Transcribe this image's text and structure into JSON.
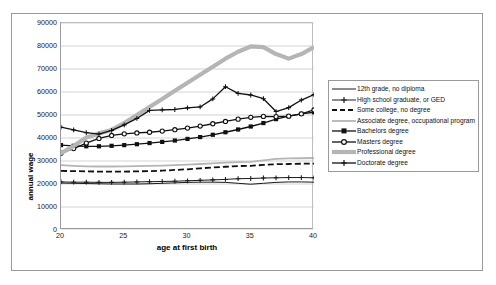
{
  "chart_data": {
    "type": "line",
    "title": "",
    "xlabel": "age at first birth",
    "ylabel": "annual wage",
    "xlim": [
      20,
      40
    ],
    "ylim": [
      0,
      90000
    ],
    "ytick_values": [
      0,
      10000,
      20000,
      30000,
      40000,
      50000,
      60000,
      70000,
      80000,
      90000
    ],
    "ytick_labels": [
      "0",
      "10000",
      "20000",
      "30000",
      "40000",
      "50000",
      "60000",
      "70000",
      "80000",
      "90000"
    ],
    "xtick_values": [
      20,
      25,
      30,
      35,
      40
    ],
    "xtick_labels": [
      "20",
      "25",
      "30",
      "35",
      "40"
    ],
    "grid": "horizontal",
    "legend_position": "right",
    "x": [
      20,
      21,
      22,
      23,
      24,
      25,
      26,
      27,
      28,
      29,
      30,
      31,
      32,
      33,
      34,
      35,
      36,
      37,
      38,
      39,
      40
    ],
    "series": [
      {
        "name": "12th grade, no diploma",
        "color": "#1a1a1a",
        "style": "solid",
        "width": 1.0,
        "marker": "none",
        "values": [
          20400,
          20300,
          20200,
          20100,
          20000,
          20000,
          20000,
          20100,
          20300,
          20500,
          20700,
          20800,
          20800,
          20700,
          20300,
          19900,
          20300,
          20700,
          20900,
          20900,
          20800
        ]
      },
      {
        "name": "High school graduate, or GED",
        "color": "#1a1a1a",
        "style": "solid",
        "width": 1.0,
        "marker": "plus",
        "values": [
          20900,
          20800,
          20800,
          20700,
          20700,
          20800,
          20900,
          21000,
          21100,
          21200,
          21400,
          21600,
          21800,
          22000,
          22300,
          22400,
          22600,
          22700,
          22800,
          22800,
          22700
        ]
      },
      {
        "name": "Some college, no degree",
        "color": "#111111",
        "style": "dashed",
        "width": 1.8,
        "marker": "none",
        "values": [
          25700,
          25600,
          25500,
          25400,
          25400,
          25400,
          25500,
          25600,
          25800,
          26100,
          26400,
          26800,
          27200,
          27500,
          27800,
          27900,
          28300,
          28600,
          28700,
          28800,
          28900
        ]
      },
      {
        "name": "Associate degree, occupational program",
        "color": "#b5b5b5",
        "style": "solid",
        "width": 1.8,
        "marker": "none",
        "values": [
          28200,
          27900,
          27700,
          27600,
          27600,
          27700,
          27800,
          27900,
          28000,
          28200,
          28400,
          28700,
          29000,
          29300,
          29500,
          29600,
          30300,
          30900,
          31100,
          31200,
          31300
        ]
      },
      {
        "name": "Bachelors degree",
        "color": "#111111",
        "style": "solid",
        "width": 1.3,
        "marker": "square",
        "values": [
          36900,
          36600,
          36400,
          36400,
          36600,
          36900,
          37300,
          37800,
          38300,
          38900,
          39600,
          40400,
          41400,
          42500,
          43700,
          45000,
          46500,
          48200,
          49500,
          50500,
          51200
        ]
      },
      {
        "name": "Masters degree",
        "color": "#111111",
        "style": "solid",
        "width": 1.3,
        "marker": "circle",
        "values": [
          33400,
          35400,
          37800,
          39800,
          41100,
          41800,
          42200,
          42500,
          43000,
          43600,
          44300,
          45200,
          46200,
          47200,
          48200,
          49000,
          49400,
          49300,
          49500,
          50500,
          52200
        ]
      },
      {
        "name": "Professional degree",
        "color": "#b5b5b5",
        "style": "solid",
        "width": 4.2,
        "marker": "none",
        "values": [
          33400,
          36500,
          40200,
          42000,
          43500,
          46500,
          50000,
          53500,
          57000,
          60500,
          64000,
          67500,
          71000,
          74500,
          77500,
          79800,
          79500,
          76500,
          74500,
          76500,
          79500
        ]
      },
      {
        "name": "Doctorate degree",
        "color": "#111111",
        "style": "solid",
        "width": 1.3,
        "marker": "plus",
        "values": [
          44700,
          43500,
          42300,
          41700,
          43300,
          45700,
          48500,
          52000,
          52200,
          52400,
          53100,
          53500,
          57000,
          62300,
          59400,
          58700,
          57100,
          51500,
          53200,
          56500,
          58900
        ]
      }
    ]
  },
  "legend": {
    "entries": [
      "12th grade, no diploma",
      "High school graduate, or GED",
      "Some college, no degree",
      "Associate degree, occupational program",
      "Bachelors degree",
      "Masters degree",
      "Professional degree",
      "Doctorate degree"
    ]
  },
  "axes": {
    "x_title": "age at first birth",
    "y_title": "annual wage"
  }
}
